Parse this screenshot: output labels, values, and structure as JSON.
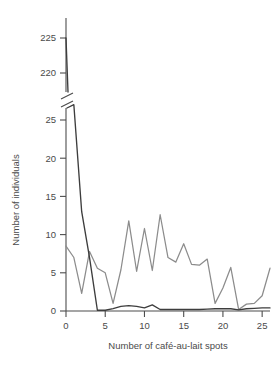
{
  "chart_data": {
    "type": "line",
    "title": "",
    "xlabel": "Number of café-au-lait spots",
    "ylabel": "Number of individuals",
    "x": [
      0,
      1,
      2,
      3,
      4,
      5,
      6,
      7,
      8,
      9,
      10,
      11,
      12,
      13,
      14,
      15,
      16,
      17,
      18,
      19,
      20,
      21,
      22,
      23,
      24,
      25,
      26
    ],
    "xlim": [
      0,
      26
    ],
    "xticks": [
      0,
      5,
      10,
      15,
      20,
      25
    ],
    "xticklabels": [
      "0",
      "5",
      "10",
      "15",
      "20",
      "25"
    ],
    "ylim_lower": [
      0,
      27
    ],
    "ylim_upper": [
      218,
      227
    ],
    "yticks_lower": [
      0,
      5,
      10,
      15,
      20,
      25
    ],
    "yticklabels_lower": [
      "0",
      "5",
      "10",
      "15",
      "20",
      "25"
    ],
    "yticks_upper": [
      220,
      225
    ],
    "yticklabels_upper": [
      "220",
      "225"
    ],
    "axis_break": true,
    "grid": false,
    "legend": "none",
    "series": [
      {
        "name": "dark-series",
        "color": "#3d3d3d",
        "values": [
          225,
          27,
          13,
          7,
          0.1,
          0.1,
          0.3,
          0.6,
          0.7,
          0.6,
          0.4,
          0.8,
          0.2,
          0.2,
          0.2,
          0.2,
          0.2,
          0.2,
          0.25,
          0.3,
          0.3,
          0.3,
          0.15,
          0.3,
          0.35,
          0.4,
          0.4
        ]
      },
      {
        "name": "gray-series",
        "color": "#8c8c8c",
        "values": [
          8.5,
          7.0,
          2.3,
          7.8,
          5.6,
          5.0,
          1.0,
          5.4,
          11.8,
          5.2,
          10.8,
          5.3,
          12.6,
          7.0,
          6.4,
          8.8,
          6.1,
          6.0,
          6.8,
          1.0,
          3.0,
          5.7,
          0.2,
          0.9,
          1.0,
          2.0,
          5.6
        ]
      }
    ]
  },
  "figure": {
    "x_axis_title": "Number of café-au-lait spots",
    "y_axis_title": "Number of individuals"
  }
}
